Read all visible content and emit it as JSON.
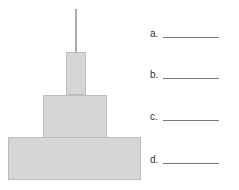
{
  "diagram": {
    "parts": [
      {
        "id": "antenna",
        "label": "a."
      },
      {
        "id": "top-block",
        "label": "b."
      },
      {
        "id": "middle-block",
        "label": "c."
      },
      {
        "id": "base-block",
        "label": "d."
      }
    ],
    "labels": [
      "a.",
      "b.",
      "c.",
      "d."
    ],
    "colors": {
      "fill": "#d6d6d6",
      "antenna": "#aaaaaa",
      "line": "#777777"
    }
  }
}
